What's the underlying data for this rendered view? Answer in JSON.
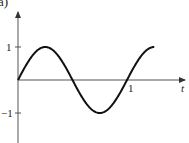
{
  "chart_data": {
    "type": "line",
    "title": "",
    "panel_label": "a)",
    "xlabel": "t",
    "ylabel": "",
    "x_ticks": [
      {
        "value": 1,
        "label": "1"
      }
    ],
    "y_ticks": [
      {
        "value": 1,
        "label": "1"
      },
      {
        "value": -1,
        "label": "−1"
      }
    ],
    "xlim": [
      0,
      1.3
    ],
    "ylim": [
      -1.3,
      1.6
    ],
    "grid": false,
    "legend": null,
    "series": [
      {
        "name": "sin(2πt)",
        "function": "sin(2*pi*t)",
        "x": [
          0,
          0.125,
          0.25,
          0.375,
          0.5,
          0.625,
          0.75,
          0.875,
          1.0,
          1.125,
          1.25
        ],
        "y": [
          0,
          0.707,
          1,
          0.707,
          0,
          -0.707,
          -1,
          -0.707,
          0,
          0.707,
          1
        ]
      }
    ],
    "colors": {
      "line": "#111111",
      "axes": "#444444"
    }
  }
}
